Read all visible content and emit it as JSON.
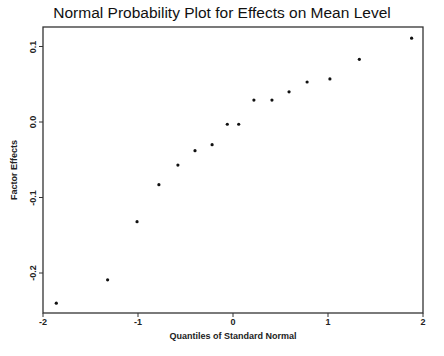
{
  "chart_data": {
    "type": "scatter",
    "title": "Normal Probability Plot for Effects on Mean Level",
    "xlabel": "Quantiles of Standard Normal",
    "ylabel": "Factor Effects",
    "xlim": [
      -2,
      2
    ],
    "ylim": [
      -0.25,
      0.125
    ],
    "xticks": [
      "-2",
      "-1",
      "0",
      "1",
      "2"
    ],
    "yticks": [
      "-0.2",
      "-0.1",
      "0.0",
      "0.1"
    ],
    "grid": false,
    "legend": null,
    "points": [
      {
        "x": -1.86,
        "y": -0.24
      },
      {
        "x": -1.32,
        "y": -0.209
      },
      {
        "x": -1.01,
        "y": -0.132
      },
      {
        "x": -0.78,
        "y": -0.083
      },
      {
        "x": -0.58,
        "y": -0.057
      },
      {
        "x": -0.4,
        "y": -0.038
      },
      {
        "x": -0.22,
        "y": -0.03
      },
      {
        "x": -0.06,
        "y": -0.003
      },
      {
        "x": 0.06,
        "y": -0.003
      },
      {
        "x": 0.22,
        "y": 0.029
      },
      {
        "x": 0.41,
        "y": 0.029
      },
      {
        "x": 0.59,
        "y": 0.04
      },
      {
        "x": 0.78,
        "y": 0.053
      },
      {
        "x": 1.02,
        "y": 0.057
      },
      {
        "x": 1.33,
        "y": 0.083
      },
      {
        "x": 1.88,
        "y": 0.111
      }
    ]
  },
  "colors": {
    "axis": "#333333",
    "marker": "#111111",
    "background": "#ffffff"
  }
}
